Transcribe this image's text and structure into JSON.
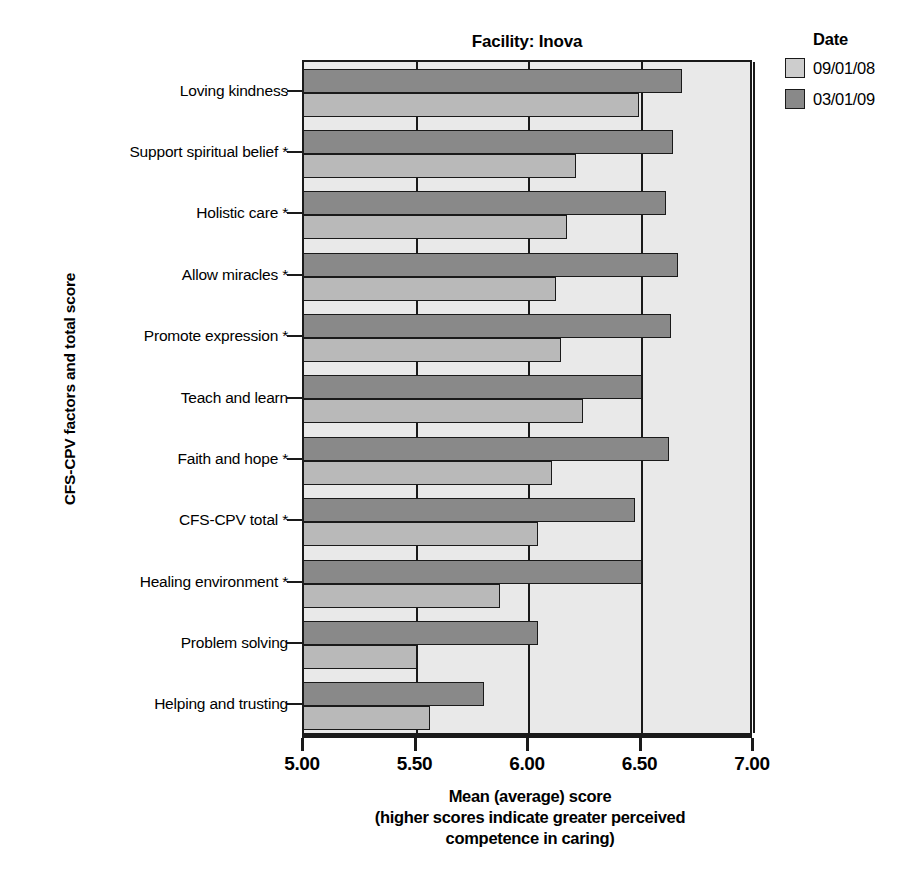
{
  "chart_data": {
    "type": "bar",
    "orientation": "horizontal",
    "title": "Facility: Inova",
    "xlabel_lines": [
      "Mean (average) score",
      "(higher scores indicate greater perceived",
      "competence in caring)"
    ],
    "ylabel": "CFS-CPV factors and total score",
    "xlim": [
      5.0,
      7.0
    ],
    "xticks": [
      5.0,
      5.5,
      6.0,
      6.5,
      7.0
    ],
    "xtick_labels": [
      "5.00",
      "5.50",
      "6.00",
      "6.50",
      "7.00"
    ],
    "grid": true,
    "legend_title": "Date",
    "legend_position": "right",
    "categories": [
      "Loving kindness",
      "Support spiritual belief *",
      "Holistic care *",
      "Allow miracles *",
      "Promote expression *",
      "Teach and learn",
      "Faith and hope *",
      "CFS-CPV total *",
      "Healing environment *",
      "Problem solving",
      "Helping and trusting"
    ],
    "series": [
      {
        "name": "09/01/08",
        "color": "#b9b9b9",
        "values": [
          6.49,
          6.21,
          6.17,
          6.12,
          6.14,
          6.24,
          6.1,
          6.04,
          5.87,
          5.5,
          5.56
        ]
      },
      {
        "name": "03/01/09",
        "color": "#898989",
        "values": [
          6.68,
          6.64,
          6.61,
          6.66,
          6.63,
          6.5,
          6.62,
          6.47,
          6.5,
          6.04,
          5.8
        ]
      }
    ]
  },
  "legend": {
    "title": "Date",
    "items": [
      {
        "label": "09/01/08",
        "swatch": "light-gray-swatch"
      },
      {
        "label": "03/01/09",
        "swatch": "dark-gray-swatch"
      }
    ]
  },
  "colors": {
    "panel_background": "#e9e9e9",
    "axis": "#1a1a1a",
    "series_09_01_08": "#b9b9b9",
    "series_03_01_09": "#898989",
    "page_background": "#ffffff"
  }
}
